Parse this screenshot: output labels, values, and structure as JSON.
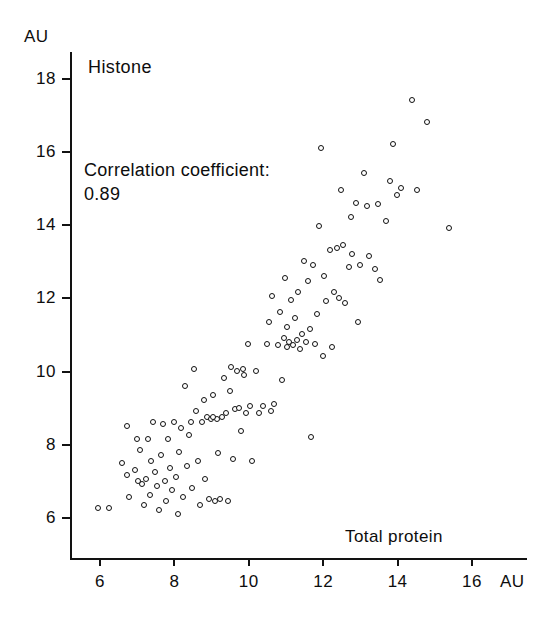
{
  "chart_data": {
    "type": "scatter",
    "title": "Histone",
    "xlabel": "Total protein",
    "ylabel": "",
    "x_unit": "AU",
    "y_unit": "AU",
    "xlim": [
      5.2,
      16.6
    ],
    "ylim": [
      5.4,
      18.6
    ],
    "xticks": [
      6,
      8,
      10,
      12,
      14,
      16
    ],
    "yticks": [
      6,
      8,
      10,
      12,
      14,
      16,
      18
    ],
    "grid": false,
    "legend": null,
    "annotations": [
      "Correlation coefficient:",
      "0.89"
    ],
    "correlation_coefficient": 0.89,
    "marker": "open-circle",
    "n_points": 136,
    "points": [
      [
        5.95,
        6.25
      ],
      [
        6.25,
        6.25
      ],
      [
        6.6,
        7.5
      ],
      [
        6.75,
        8.5
      ],
      [
        6.75,
        7.15
      ],
      [
        6.8,
        6.55
      ],
      [
        6.95,
        7.3
      ],
      [
        7.0,
        8.15
      ],
      [
        7.1,
        7.85
      ],
      [
        7.15,
        6.9
      ],
      [
        7.2,
        6.35
      ],
      [
        7.25,
        7.05
      ],
      [
        7.3,
        8.15
      ],
      [
        7.35,
        6.6
      ],
      [
        7.4,
        7.55
      ],
      [
        7.45,
        8.6
      ],
      [
        7.5,
        7.25
      ],
      [
        7.55,
        6.85
      ],
      [
        7.6,
        6.2
      ],
      [
        7.65,
        7.7
      ],
      [
        7.7,
        8.55
      ],
      [
        7.75,
        7.0
      ],
      [
        7.8,
        6.45
      ],
      [
        7.85,
        8.15
      ],
      [
        7.9,
        7.35
      ],
      [
        7.95,
        6.75
      ],
      [
        8.0,
        8.6
      ],
      [
        8.05,
        7.1
      ],
      [
        8.1,
        6.1
      ],
      [
        8.15,
        7.8
      ],
      [
        8.2,
        8.45
      ],
      [
        8.25,
        6.55
      ],
      [
        8.3,
        9.6
      ],
      [
        8.35,
        7.4
      ],
      [
        8.4,
        8.25
      ],
      [
        8.5,
        6.8
      ],
      [
        8.55,
        10.05
      ],
      [
        8.6,
        8.9
      ],
      [
        8.65,
        7.55
      ],
      [
        8.7,
        6.35
      ],
      [
        8.75,
        8.6
      ],
      [
        8.8,
        9.2
      ],
      [
        8.85,
        7.05
      ],
      [
        8.9,
        8.75
      ],
      [
        8.95,
        6.5
      ],
      [
        9.0,
        8.7
      ],
      [
        9.05,
        9.35
      ],
      [
        9.1,
        6.45
      ],
      [
        9.15,
        8.7
      ],
      [
        9.2,
        7.75
      ],
      [
        9.25,
        6.5
      ],
      [
        9.3,
        8.75
      ],
      [
        9.35,
        9.8
      ],
      [
        9.4,
        8.85
      ],
      [
        9.45,
        6.45
      ],
      [
        9.5,
        9.45
      ],
      [
        9.55,
        10.1
      ],
      [
        9.6,
        7.6
      ],
      [
        9.65,
        8.95
      ],
      [
        9.7,
        10.0
      ],
      [
        9.75,
        9.0
      ],
      [
        9.8,
        8.35
      ],
      [
        9.85,
        10.05
      ],
      [
        9.9,
        9.9
      ],
      [
        9.95,
        8.85
      ],
      [
        10.0,
        10.75
      ],
      [
        10.05,
        9.05
      ],
      [
        10.1,
        7.55
      ],
      [
        10.2,
        10.0
      ],
      [
        10.3,
        8.85
      ],
      [
        10.4,
        9.05
      ],
      [
        10.5,
        10.75
      ],
      [
        10.55,
        11.35
      ],
      [
        10.6,
        8.9
      ],
      [
        10.65,
        12.05
      ],
      [
        10.7,
        9.1
      ],
      [
        10.8,
        10.7
      ],
      [
        10.85,
        11.6
      ],
      [
        10.9,
        9.75
      ],
      [
        11.0,
        12.55
      ],
      [
        11.05,
        10.65
      ],
      [
        11.1,
        10.8
      ],
      [
        11.15,
        11.95
      ],
      [
        11.2,
        10.7
      ],
      [
        11.25,
        11.45
      ],
      [
        11.3,
        10.85
      ],
      [
        11.35,
        12.15
      ],
      [
        11.4,
        10.6
      ],
      [
        11.45,
        11.0
      ],
      [
        11.5,
        13.0
      ],
      [
        11.55,
        10.8
      ],
      [
        11.6,
        12.45
      ],
      [
        11.65,
        11.15
      ],
      [
        11.7,
        8.2
      ],
      [
        11.75,
        12.9
      ],
      [
        11.8,
        10.75
      ],
      [
        11.85,
        11.55
      ],
      [
        11.9,
        13.95
      ],
      [
        11.95,
        16.1
      ],
      [
        12.0,
        10.4
      ],
      [
        12.05,
        12.6
      ],
      [
        12.1,
        11.9
      ],
      [
        12.2,
        13.3
      ],
      [
        12.25,
        10.65
      ],
      [
        12.3,
        12.15
      ],
      [
        12.4,
        13.35
      ],
      [
        12.45,
        12.0
      ],
      [
        12.5,
        14.95
      ],
      [
        12.55,
        13.45
      ],
      [
        12.6,
        11.85
      ],
      [
        12.7,
        12.85
      ],
      [
        12.75,
        14.2
      ],
      [
        12.8,
        13.2
      ],
      [
        12.9,
        14.6
      ],
      [
        12.95,
        11.35
      ],
      [
        13.0,
        12.9
      ],
      [
        13.1,
        15.4
      ],
      [
        13.2,
        14.5
      ],
      [
        13.25,
        13.15
      ],
      [
        13.4,
        12.8
      ],
      [
        13.5,
        14.55
      ],
      [
        13.55,
        12.5
      ],
      [
        13.7,
        14.1
      ],
      [
        13.8,
        15.2
      ],
      [
        13.9,
        16.2
      ],
      [
        14.0,
        14.8
      ],
      [
        14.1,
        15.0
      ],
      [
        14.4,
        17.4
      ],
      [
        14.55,
        14.95
      ],
      [
        14.8,
        16.8
      ],
      [
        15.4,
        13.9
      ],
      [
        10.95,
        10.9
      ],
      [
        11.05,
        11.2
      ],
      [
        9.05,
        8.75
      ],
      [
        8.45,
        8.6
      ],
      [
        7.05,
        7.0
      ]
    ]
  },
  "axis_labels": {
    "y_unit_label": "AU",
    "x_unit_label": "AU",
    "x_tick_labels": [
      "6",
      "8",
      "10",
      "12",
      "14",
      "16"
    ],
    "y_tick_labels": [
      "6",
      "8",
      "10",
      "12",
      "14",
      "16",
      "18"
    ]
  },
  "colors": {
    "ink": "#101010",
    "background": "#ffffff"
  }
}
